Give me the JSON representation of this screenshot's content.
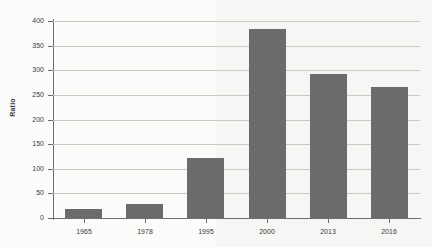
{
  "chart_data": {
    "type": "bar",
    "title": "",
    "subtitle": "",
    "xlabel": "",
    "ylabel": "Ratio",
    "categories": [
      "1965",
      "1978",
      "1995",
      "2000",
      "2013",
      "2016"
    ],
    "values": [
      19,
      29,
      122,
      383,
      293,
      267
    ],
    "series": [
      {
        "name": "Ratio",
        "values": [
          19,
          29,
          122,
          383,
          293,
          267
        ]
      }
    ],
    "ylim": [
      0,
      400
    ],
    "ytick_labels": [
      "0",
      "50",
      "100",
      "150",
      "200",
      "250",
      "300",
      "350",
      "400"
    ],
    "ytick_values": [
      0,
      50,
      100,
      150,
      200,
      250,
      300,
      350,
      400
    ],
    "grid": "horizontal",
    "legend": "none",
    "bar_color": "#6b6b6b",
    "background_color": "#fbfbfa",
    "axis_color": "#6d6d6b",
    "gridline_color": "#c9c9c6"
  }
}
